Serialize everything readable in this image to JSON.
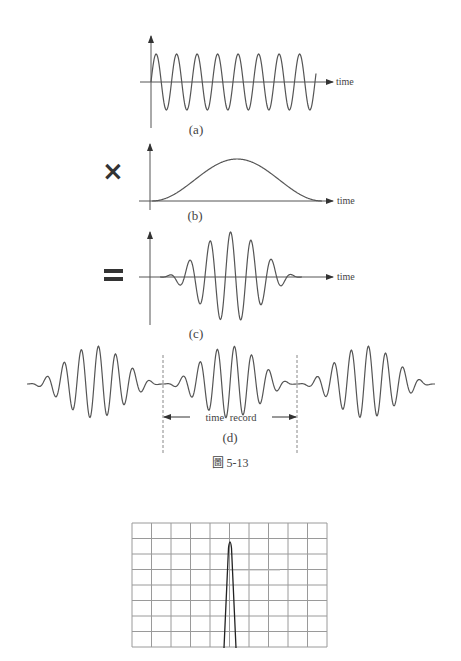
{
  "figure": {
    "caption": "圖 5-13",
    "panels": {
      "a": {
        "label": "(a)",
        "axis_label": "time",
        "description": "continuous sine wave"
      },
      "b": {
        "label": "(b)",
        "axis_label": "time",
        "operator": "×",
        "description": "Hanning window (raised cosine)"
      },
      "c": {
        "label": "(c)",
        "axis_label": "time",
        "operator": "=",
        "description": "windowed sine wave"
      },
      "d": {
        "label": "(d)",
        "span_label": "time record",
        "description": "periodically repeated windowed time record"
      }
    },
    "spectrum": {
      "grid_columns": 10,
      "grid_rows": 8,
      "description": "single narrow spectral line"
    }
  },
  "colors": {
    "line": "#555555",
    "grid": "#9a9a9a",
    "text": "#444444",
    "operator": "#333333"
  }
}
